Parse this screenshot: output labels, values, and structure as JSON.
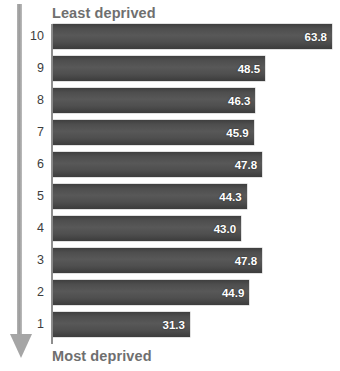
{
  "annotations": {
    "top_label": "Least deprived",
    "bottom_label": "Most deprived",
    "arrow_icon": "down-arrow-icon",
    "title_remnant": ""
  },
  "chart_data": {
    "type": "bar",
    "orientation": "horizontal",
    "title": "",
    "xlabel": "",
    "ylabel": "",
    "xlim": [
      0,
      63.8
    ],
    "grid": false,
    "legend": null,
    "categories": [
      "10",
      "9",
      "8",
      "7",
      "6",
      "5",
      "4",
      "3",
      "2",
      "1"
    ],
    "values": [
      63.8,
      48.5,
      46.3,
      45.9,
      47.8,
      44.3,
      43.0,
      47.8,
      44.9,
      31.3
    ],
    "value_labels": [
      "63.8",
      "48.5",
      "46.3",
      "45.9",
      "47.8",
      "44.3",
      "43.0",
      "47.8",
      "44.9",
      "31.3"
    ],
    "bar_color": "#4e4e4e",
    "value_label_color": "#ffffff",
    "axis_color": "#8e8e8e",
    "annotation_color": "#6f6f6f"
  }
}
